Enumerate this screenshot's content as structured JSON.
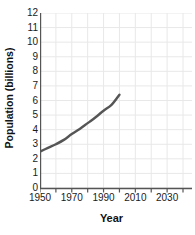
{
  "chart_data": {
    "type": "line",
    "title": "",
    "xlabel": "Year",
    "ylabel": "Population (billions)",
    "xlim": [
      1950,
      2040
    ],
    "ylim": [
      0,
      12
    ],
    "grid": true,
    "legend": "none",
    "line_color": "#555555",
    "grid_color": "#e8e8e8",
    "axis_color": "#555555",
    "x_major_ticks": [
      1950,
      1970,
      1990,
      2010,
      2030
    ],
    "x_major_tick_labels": [
      "1950",
      "1970",
      "1990",
      "2010",
      "2030"
    ],
    "x_minor_ticks": [
      1960,
      1980,
      2000,
      2020,
      2040
    ],
    "y_ticks": [
      0,
      1,
      2,
      3,
      4,
      5,
      6,
      7,
      8,
      9,
      10,
      11,
      12
    ],
    "y_tick_labels": [
      "0",
      "1",
      "2",
      "3",
      "4",
      "5",
      "6",
      "7",
      "8",
      "9",
      "10",
      "11",
      "12"
    ],
    "series": [
      {
        "name": "World population",
        "x": [
          1950,
          1955,
          1960,
          1965,
          1970,
          1975,
          1980,
          1985,
          1990,
          1995,
          2000
        ],
        "values": [
          2.5,
          2.75,
          3.0,
          3.3,
          3.7,
          4.05,
          4.45,
          4.85,
          5.3,
          5.7,
          6.4
        ]
      }
    ]
  }
}
